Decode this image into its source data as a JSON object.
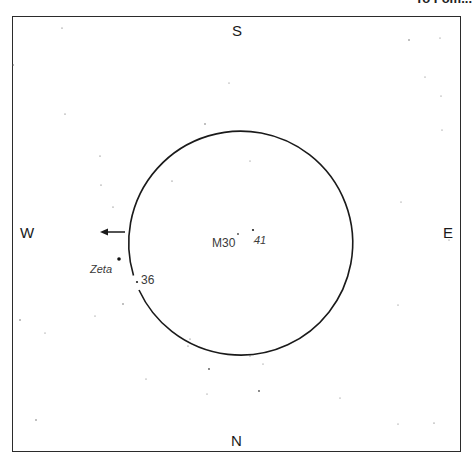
{
  "header": {
    "title_fragment": "To Fom..."
  },
  "compass": {
    "top": "S",
    "bottom": "N",
    "left": "W",
    "right": "E"
  },
  "field_circle": {
    "cx": 237,
    "cy": 233,
    "r": 112,
    "stroke": "#1a1a1a"
  },
  "motion_arrow": {
    "direction": "west",
    "x1": 125,
    "x2": 101,
    "y": 232
  },
  "objects": [
    {
      "id": "m30",
      "label": "M30",
      "x": 238,
      "y": 234
    },
    {
      "id": "star-41",
      "label": "41",
      "x": 253,
      "y": 230
    },
    {
      "id": "zeta",
      "label": "Zeta",
      "x": 119,
      "y": 259
    },
    {
      "id": "star-36",
      "label": "36",
      "x": 137,
      "y": 282
    }
  ],
  "stars": [
    {
      "x": 62,
      "y": 28,
      "r": 0.6
    },
    {
      "x": 13,
      "y": 65,
      "r": 0.8
    },
    {
      "x": 65,
      "y": 114,
      "r": 0.6
    },
    {
      "x": 100,
      "y": 156,
      "r": 0.6
    },
    {
      "x": 101,
      "y": 185,
      "r": 0.6
    },
    {
      "x": 113,
      "y": 207,
      "r": 0.6
    },
    {
      "x": 205,
      "y": 124,
      "r": 0.7
    },
    {
      "x": 229,
      "y": 83,
      "r": 0.5
    },
    {
      "x": 172,
      "y": 181,
      "r": 0.6
    },
    {
      "x": 409,
      "y": 40,
      "r": 0.7
    },
    {
      "x": 440,
      "y": 38,
      "r": 0.5
    },
    {
      "x": 425,
      "y": 77,
      "r": 0.5
    },
    {
      "x": 441,
      "y": 96,
      "r": 0.5
    },
    {
      "x": 442,
      "y": 130,
      "r": 0.5
    },
    {
      "x": 250,
      "y": 161,
      "r": 0.5
    },
    {
      "x": 401,
      "y": 202,
      "r": 0.5
    },
    {
      "x": 123,
      "y": 304,
      "r": 0.7
    },
    {
      "x": 95,
      "y": 316,
      "r": 0.5
    },
    {
      "x": 20,
      "y": 320,
      "r": 0.7
    },
    {
      "x": 45,
      "y": 333,
      "r": 0.5
    },
    {
      "x": 190,
      "y": 339,
      "r": 0.6
    },
    {
      "x": 188,
      "y": 346,
      "r": 0.6
    },
    {
      "x": 209,
      "y": 369,
      "r": 0.9
    },
    {
      "x": 146,
      "y": 379,
      "r": 0.5
    },
    {
      "x": 207,
      "y": 394,
      "r": 0.5
    },
    {
      "x": 36,
      "y": 420,
      "r": 0.7
    },
    {
      "x": 259,
      "y": 391,
      "r": 0.9
    },
    {
      "x": 250,
      "y": 356,
      "r": 0.5
    },
    {
      "x": 263,
      "y": 364,
      "r": 0.5
    },
    {
      "x": 340,
      "y": 398,
      "r": 0.5
    },
    {
      "x": 398,
      "y": 424,
      "r": 0.5
    },
    {
      "x": 434,
      "y": 423,
      "r": 0.6
    },
    {
      "x": 398,
      "y": 305,
      "r": 0.5
    },
    {
      "x": 449,
      "y": 240,
      "r": 0.5
    },
    {
      "x": 254,
      "y": 242,
      "r": 0.5
    }
  ]
}
